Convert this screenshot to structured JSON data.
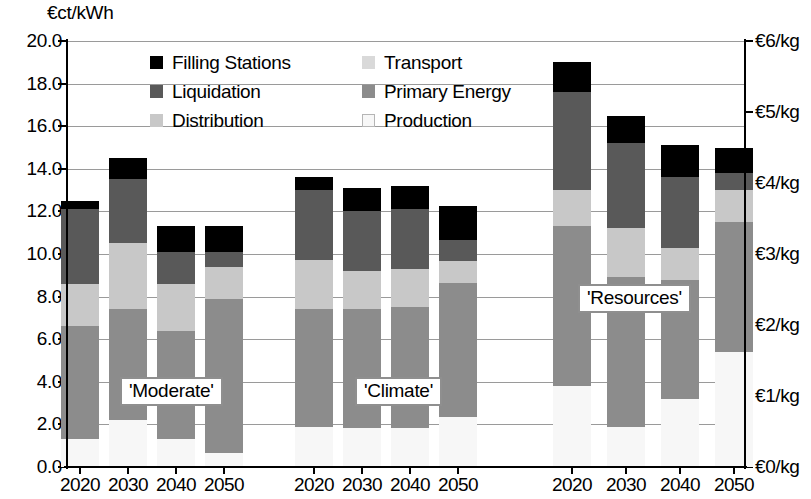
{
  "chart_data": {
    "type": "bar",
    "subtype": "stacked-bar-grouped",
    "title": "",
    "ylabel": "€ct/kWh",
    "ylabel_right": "€/kg",
    "ylim": [
      0,
      20
    ],
    "ylim_right": [
      0,
      6
    ],
    "yticks": [
      "0.0",
      "2.0",
      "4.0",
      "6.0",
      "8.0",
      "10.0",
      "12.0",
      "14.0",
      "16.0",
      "18.0",
      "20.0"
    ],
    "yticks_right": [
      "€0/kg",
      "€1/kg",
      "€2/kg",
      "€3/kg",
      "€4/kg",
      "€5/kg",
      "€6/kg"
    ],
    "grid": true,
    "legend_position": "upper-center-inside",
    "legend": [
      {
        "label": "Filling Stations",
        "color": "#000000"
      },
      {
        "label": "Transport",
        "color": "#d9d9d9"
      },
      {
        "label": "Liquidation",
        "color": "#595959"
      },
      {
        "label": "Primary Energy",
        "color": "#8c8c8c"
      },
      {
        "label": "Distribution",
        "color": "#c8c8c8"
      },
      {
        "label": "Production",
        "color": "#f7f7f7"
      }
    ],
    "stack_order_bottom_to_top": [
      "Production",
      "Primary Energy",
      "Distribution",
      "Liquidation",
      "Filling Stations"
    ],
    "annotations": [
      "'Moderate'",
      "'Climate'",
      "'Resources'"
    ],
    "groups": [
      {
        "name": "'Moderate'",
        "categories": [
          "2020",
          "2030",
          "2040",
          "2050"
        ],
        "bars": [
          {
            "x": "2020",
            "total": 12.5,
            "segments": {
              "Production": 1.3,
              "Primary Energy": 5.3,
              "Distribution": 2.0,
              "Liquidation": 3.5,
              "Filling Stations": 0.4
            }
          },
          {
            "x": "2030",
            "total": 14.5,
            "segments": {
              "Production": 2.2,
              "Primary Energy": 5.2,
              "Distribution": 3.1,
              "Liquidation": 3.0,
              "Filling Stations": 1.0
            }
          },
          {
            "x": "2040",
            "total": 11.3,
            "segments": {
              "Production": 1.3,
              "Primary Energy": 5.1,
              "Distribution": 2.2,
              "Liquidation": 1.5,
              "Filling Stations": 1.2
            }
          },
          {
            "x": "2050",
            "total": 11.3,
            "segments": {
              "Production": 0.65,
              "Primary Energy": 7.25,
              "Distribution": 1.5,
              "Liquidation": 0.7,
              "Filling Stations": 1.2
            }
          }
        ]
      },
      {
        "name": "'Climate'",
        "categories": [
          "2020",
          "2030",
          "2040",
          "2050"
        ],
        "bars": [
          {
            "x": "2020",
            "total": 13.6,
            "segments": {
              "Production": 1.9,
              "Primary Energy": 5.5,
              "Distribution": 2.3,
              "Liquidation": 3.3,
              "Filling Stations": 0.6
            }
          },
          {
            "x": "2030",
            "total": 13.1,
            "segments": {
              "Production": 1.85,
              "Primary Energy": 5.55,
              "Distribution": 1.8,
              "Liquidation": 2.8,
              "Filling Stations": 1.1
            }
          },
          {
            "x": "2040",
            "total": 13.2,
            "segments": {
              "Production": 1.85,
              "Primary Energy": 5.65,
              "Distribution": 1.8,
              "Liquidation": 2.8,
              "Filling Stations": 1.1
            }
          },
          {
            "x": "2050",
            "total": 12.25,
            "segments": {
              "Production": 2.35,
              "Primary Energy": 6.3,
              "Distribution": 1.0,
              "Liquidation": 1.0,
              "Filling Stations": 1.6
            }
          }
        ]
      },
      {
        "name": "'Resources'",
        "categories": [
          "2020",
          "2030",
          "2040",
          "2050"
        ],
        "bars": [
          {
            "x": "2020",
            "total": 19.0,
            "segments": {
              "Production": 3.8,
              "Primary Energy": 7.5,
              "Distribution": 1.7,
              "Liquidation": 4.6,
              "Filling Stations": 1.4
            }
          },
          {
            "x": "2030",
            "total": 16.5,
            "segments": {
              "Production": 1.9,
              "Primary Energy": 7.0,
              "Distribution": 2.3,
              "Liquidation": 4.0,
              "Filling Stations": 1.3
            }
          },
          {
            "x": "2040",
            "total": 15.1,
            "segments": {
              "Production": 3.2,
              "Primary Energy": 5.6,
              "Distribution": 1.5,
              "Liquidation": 3.3,
              "Filling Stations": 1.5
            }
          },
          {
            "x": "2050",
            "total": 15.0,
            "segments": {
              "Production": 5.4,
              "Primary Energy": 6.1,
              "Distribution": 1.5,
              "Liquidation": 0.8,
              "Filling Stations": 1.2
            }
          }
        ]
      }
    ]
  }
}
